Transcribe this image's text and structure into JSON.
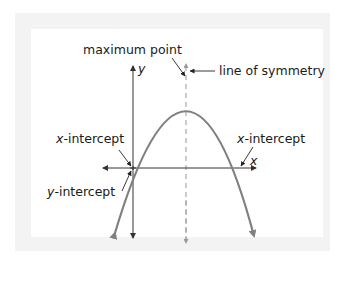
{
  "diagram": {
    "type": "parabola-annotation",
    "labels": {
      "maximum_point": "maximum point",
      "line_of_symmetry": "line of symmetry",
      "x_intercept_left_var": "x",
      "x_intercept_left_rest": "-intercept",
      "x_intercept_right_var": "x",
      "x_intercept_right_rest": "-intercept",
      "y_intercept_var": "y",
      "y_intercept_rest": "-intercept",
      "x_axis": "x",
      "y_axis": "y"
    },
    "colors": {
      "curve": "#808080",
      "axes": "#333333",
      "symmetry_line": "#999999",
      "frame": "#f3f3f3",
      "text": "#1a1a1a"
    }
  }
}
